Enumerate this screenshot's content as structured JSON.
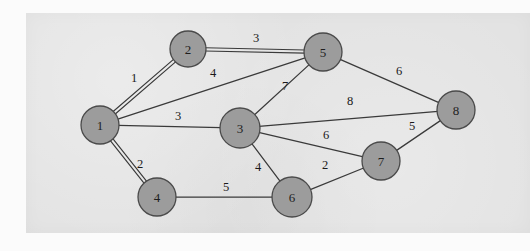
{
  "figure": {
    "type": "weighted-undirected-graph",
    "panel_background_color": "#e3e3e3",
    "page_background_color": "#fbfbfb",
    "node_fill_color": "#9c9c9c",
    "node_stroke_color": "#4a4a4a",
    "edge_color": "#3a3a3a"
  },
  "graph_data": {
    "type": "graph",
    "directed": false,
    "weighted": true,
    "nodes": [
      {
        "id": "1",
        "label": "1",
        "cx": 100,
        "cy": 125,
        "r": 19
      },
      {
        "id": "2",
        "label": "2",
        "cx": 188,
        "cy": 49,
        "r": 18
      },
      {
        "id": "3",
        "label": "3",
        "cx": 240,
        "cy": 128,
        "r": 20
      },
      {
        "id": "4",
        "label": "4",
        "cx": 157,
        "cy": 197,
        "r": 19
      },
      {
        "id": "5",
        "label": "5",
        "cx": 323,
        "cy": 52,
        "r": 19
      },
      {
        "id": "6",
        "label": "6",
        "cx": 292,
        "cy": 197,
        "r": 20
      },
      {
        "id": "7",
        "label": "7",
        "cx": 381,
        "cy": 161,
        "r": 19
      },
      {
        "id": "8",
        "label": "8",
        "cx": 456,
        "cy": 110,
        "r": 19
      }
    ],
    "edges": [
      {
        "id": "e-1-2",
        "source": "1",
        "target": "2",
        "weight": "1",
        "double": true,
        "lx": 134,
        "ly": 78
      },
      {
        "id": "e-1-5",
        "source": "1",
        "target": "5",
        "weight": "4",
        "double": false,
        "lx": 213,
        "ly": 73
      },
      {
        "id": "e-1-3",
        "source": "1",
        "target": "3",
        "weight": "3",
        "double": false,
        "lx": 178,
        "ly": 116
      },
      {
        "id": "e-1-4",
        "source": "1",
        "target": "4",
        "weight": "2",
        "double": true,
        "lx": 140,
        "ly": 164
      },
      {
        "id": "e-2-5",
        "source": "2",
        "target": "5",
        "weight": "3",
        "double": true,
        "lx": 256,
        "ly": 38
      },
      {
        "id": "e-3-5",
        "source": "3",
        "target": "5",
        "weight": "7",
        "double": false,
        "lx": 285,
        "ly": 86
      },
      {
        "id": "e-5-8",
        "source": "5",
        "target": "8",
        "weight": "6",
        "double": false,
        "lx": 399,
        "ly": 71
      },
      {
        "id": "e-3-8",
        "source": "3",
        "target": "8",
        "weight": "8",
        "double": false,
        "lx": 350,
        "ly": 101
      },
      {
        "id": "e-3-7",
        "source": "3",
        "target": "7",
        "weight": "6",
        "double": false,
        "lx": 326,
        "ly": 135
      },
      {
        "id": "e-7-8",
        "source": "7",
        "target": "8",
        "weight": "5",
        "double": false,
        "lx": 412,
        "ly": 126
      },
      {
        "id": "e-3-6",
        "source": "3",
        "target": "6",
        "weight": "4",
        "double": false,
        "lx": 258,
        "ly": 167
      },
      {
        "id": "e-6-7",
        "source": "6",
        "target": "7",
        "weight": "2",
        "double": false,
        "lx": 325,
        "ly": 165
      },
      {
        "id": "e-4-6",
        "source": "4",
        "target": "6",
        "weight": "5",
        "double": false,
        "lx": 226,
        "ly": 187
      }
    ]
  }
}
